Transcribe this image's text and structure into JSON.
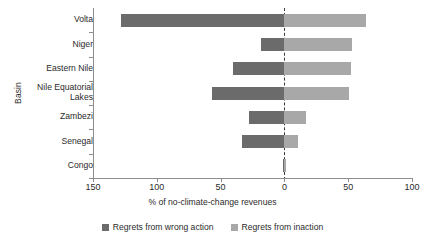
{
  "chart_data": {
    "type": "bar",
    "orientation": "horizontal",
    "style": "diverging-stacked",
    "title": "",
    "xlabel": "% of no-climate-change revenues",
    "ylabel": "Basin",
    "categories": [
      "Volta",
      "Niger",
      "Eastern Nile",
      "Nile Equatorial\nLakes",
      "Zambezi",
      "Senegal",
      "Congo"
    ],
    "xlim": [
      -150,
      100
    ],
    "xticks": [
      -150,
      -100,
      -50,
      0,
      50,
      100
    ],
    "xtick_labels": [
      "150",
      "100",
      "50",
      "0",
      "50",
      "100"
    ],
    "grid": false,
    "zero_reference_line": true,
    "legend_position": "bottom",
    "series": [
      {
        "name": "Regrets from wrong action",
        "color": "#6b6b6b",
        "values": [
          -128,
          -18,
          -40,
          -57,
          -28,
          -33,
          -1
        ]
      },
      {
        "name": "Regrets from inaction",
        "color": "#a8a8a8",
        "values": [
          64,
          53,
          52,
          51,
          17,
          11,
          1
        ]
      }
    ]
  },
  "axes": {
    "y_title": "Basin",
    "x_title": "% of no-climate-change revenues"
  },
  "legend": {
    "items": [
      {
        "label": "Regrets from wrong action",
        "color": "#6b6b6b"
      },
      {
        "label": "Regrets from inaction",
        "color": "#a8a8a8"
      }
    ]
  },
  "colors": {
    "wrong_action": "#6b6b6b",
    "inaction": "#a8a8a8",
    "axis": "#8d8d8d",
    "zero_line": "#3a3a3a",
    "text": "#2b2b2b",
    "background": "#ffffff"
  }
}
